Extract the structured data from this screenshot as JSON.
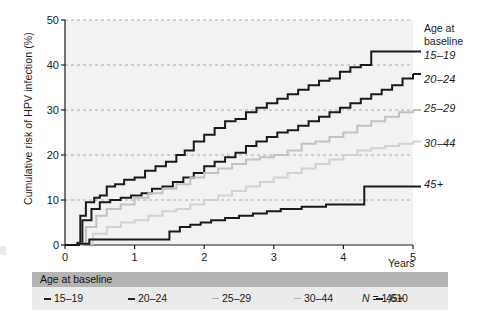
{
  "figure": {
    "background": "#ffffff",
    "plot_background": "#f2f2f2",
    "gridline_color": "#9a9a9a",
    "axis_color": "#1a1a1a"
  },
  "axes": {
    "y_title": "Cumulative risk of HPV infection (%)",
    "y_ticks": [
      "0",
      "10",
      "20",
      "30",
      "40",
      "50"
    ],
    "x_ticks": [
      "0",
      "1",
      "2",
      "3",
      "4",
      "5"
    ],
    "x_title": "Years"
  },
  "right_legend": {
    "header_line1": "Age at",
    "header_line2": "baseline",
    "labels": [
      "15–19",
      "20–24",
      "25–29",
      "30–44",
      "45+"
    ]
  },
  "bottom_legend": {
    "header": "Age at baseline",
    "items": [
      "15–19",
      "20–24",
      "25–29",
      "30–44",
      "45+"
    ],
    "n_prefix": "N",
    "n_value": "= 1,610"
  },
  "chart_data": {
    "type": "line",
    "title": "",
    "xlabel": "Years",
    "ylabel": "Cumulative risk of HPV infection (%)",
    "xlim": [
      0,
      5
    ],
    "ylim": [
      0,
      50
    ],
    "xticks": [
      0,
      1,
      2,
      3,
      4,
      5
    ],
    "yticks": [
      0,
      10,
      20,
      30,
      40,
      50
    ],
    "grid": true,
    "grid_style": "dashed-horizontal",
    "legend_position": "right",
    "step_plot": true,
    "series": [
      {
        "name": "15–19",
        "color": "#1a1a1a",
        "width": 2.0,
        "end_value": 43,
        "x": [
          0,
          0.18,
          0.22,
          0.3,
          0.42,
          0.5,
          0.6,
          0.72,
          0.85,
          1.0,
          1.15,
          1.3,
          1.45,
          1.6,
          1.72,
          1.85,
          2.0,
          2.15,
          2.3,
          2.45,
          2.6,
          2.75,
          2.9,
          3.05,
          3.2,
          3.35,
          3.5,
          3.65,
          3.8,
          3.95,
          4.1,
          4.25,
          4.4,
          5.0
        ],
        "y": [
          0,
          0.5,
          6.5,
          9.5,
          10.5,
          11.0,
          13.0,
          13.5,
          14.5,
          15.0,
          16.5,
          17.5,
          18.5,
          20.0,
          21.0,
          23.0,
          24.5,
          26.0,
          27.5,
          28.0,
          29.5,
          30.5,
          31.5,
          32.5,
          33.5,
          34.5,
          35.5,
          36.5,
          37.0,
          38.5,
          39.5,
          40.0,
          43.0,
          43.0
        ]
      },
      {
        "name": "20–24",
        "color": "#1a1a1a",
        "width": 2.0,
        "end_value": 38,
        "x": [
          0,
          0.18,
          0.25,
          0.38,
          0.5,
          0.65,
          0.8,
          0.95,
          1.1,
          1.25,
          1.4,
          1.55,
          1.7,
          1.85,
          2.0,
          2.15,
          2.3,
          2.45,
          2.6,
          2.75,
          2.9,
          3.05,
          3.2,
          3.35,
          3.5,
          3.65,
          3.8,
          3.95,
          4.1,
          4.25,
          4.4,
          4.55,
          4.7,
          4.85,
          5.0
        ],
        "y": [
          0,
          0.4,
          5.5,
          8.0,
          9.5,
          10.0,
          10.5,
          11.0,
          11.5,
          12.5,
          13.0,
          14.0,
          15.0,
          16.0,
          17.5,
          18.5,
          19.5,
          20.5,
          22.0,
          23.0,
          24.0,
          25.0,
          25.5,
          26.5,
          27.5,
          28.5,
          29.5,
          30.5,
          31.5,
          32.5,
          33.5,
          34.5,
          35.5,
          37.0,
          38.0
        ]
      },
      {
        "name": "25–29",
        "color": "#c2c2c2",
        "width": 2.0,
        "end_value": 30,
        "x": [
          0,
          0.2,
          0.3,
          0.45,
          0.6,
          0.8,
          1.0,
          1.2,
          1.4,
          1.6,
          1.8,
          2.0,
          2.2,
          2.4,
          2.6,
          2.8,
          3.0,
          3.2,
          3.4,
          3.6,
          3.8,
          4.0,
          4.2,
          4.4,
          4.6,
          4.8,
          5.0
        ],
        "y": [
          0,
          0.3,
          4.0,
          6.5,
          8.0,
          9.0,
          10.5,
          11.5,
          12.5,
          13.5,
          15.0,
          16.0,
          17.0,
          18.0,
          19.0,
          19.5,
          20.0,
          21.0,
          22.5,
          23.0,
          24.0,
          25.0,
          26.5,
          27.5,
          28.5,
          29.5,
          30.0
        ]
      },
      {
        "name": "30–44",
        "color": "#d2d2d2",
        "width": 2.0,
        "end_value": 23,
        "x": [
          0,
          0.25,
          0.4,
          0.6,
          0.8,
          1.0,
          1.2,
          1.4,
          1.6,
          1.8,
          2.0,
          2.2,
          2.4,
          2.6,
          2.8,
          3.0,
          3.2,
          3.4,
          3.6,
          3.8,
          4.0,
          4.2,
          4.4,
          4.6,
          4.8,
          5.0
        ],
        "y": [
          0,
          0.3,
          2.5,
          4.0,
          5.0,
          5.5,
          6.5,
          7.5,
          8.0,
          9.0,
          10.0,
          11.0,
          12.0,
          13.0,
          14.0,
          15.0,
          16.0,
          17.0,
          18.0,
          19.0,
          20.0,
          21.0,
          21.5,
          22.0,
          22.5,
          23.0
        ]
      },
      {
        "name": "45+",
        "color": "#1a1a1a",
        "width": 2.0,
        "end_value": 13,
        "x": [
          0,
          0.2,
          0.35,
          1.35,
          1.5,
          1.65,
          1.8,
          1.95,
          2.1,
          2.3,
          2.5,
          2.7,
          2.9,
          3.1,
          3.4,
          3.75,
          4.3,
          5.0
        ],
        "y": [
          0,
          0.3,
          1.2,
          1.2,
          3.0,
          4.0,
          4.5,
          5.0,
          5.5,
          6.0,
          6.5,
          7.0,
          7.5,
          8.0,
          8.5,
          9.0,
          13.0,
          13.0
        ]
      }
    ]
  }
}
